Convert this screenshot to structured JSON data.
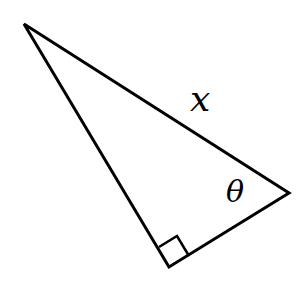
{
  "diagram": {
    "type": "right-triangle",
    "labels": {
      "hypotenuse": "x",
      "angle": "θ"
    },
    "vertices": {
      "top": [
        24,
        24
      ],
      "right": [
        289,
        193
      ],
      "right_angle": [
        169,
        267
      ]
    },
    "stroke_color": "#000000"
  }
}
